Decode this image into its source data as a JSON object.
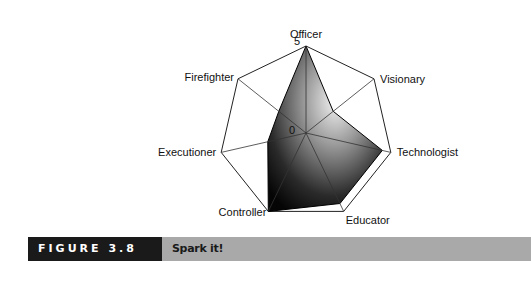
{
  "chart_data": {
    "type": "radar",
    "title": "",
    "axes": [
      "Officer",
      "Visionary",
      "Technologist",
      "Educator",
      "Controller",
      "Executioner",
      "Firefighter"
    ],
    "series": [
      {
        "name": "Spark it!",
        "values": [
          5,
          2,
          4.5,
          4.5,
          5,
          2.25,
          2
        ]
      }
    ],
    "range": [
      0,
      5
    ],
    "tick_labels": {
      "min": "0",
      "max": "5"
    },
    "grid": "spokes and outer polygon",
    "fill": "dark radial gradient"
  },
  "caption": {
    "figure_label": "FIGURE 3.8",
    "title": "Spark it!"
  }
}
